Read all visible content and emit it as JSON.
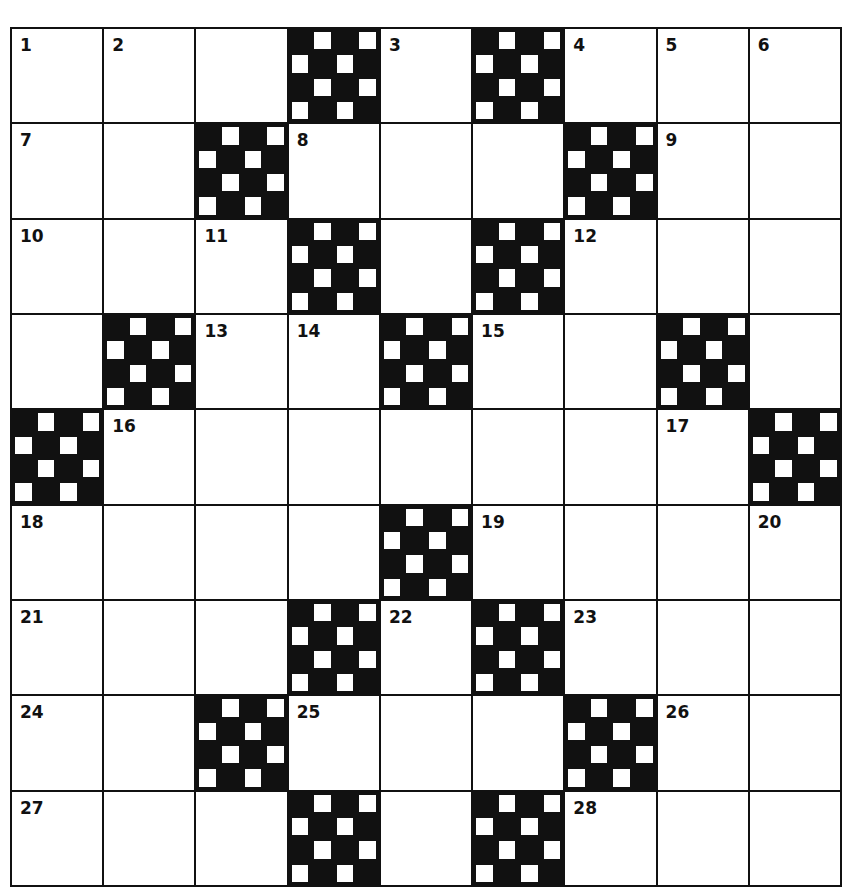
{
  "puzzle": {
    "rows": 9,
    "cols": 9,
    "colors": {
      "ink": "#111111",
      "paper": "#ffffff"
    },
    "grid": [
      [
        "1",
        "2",
        "",
        "#",
        "3",
        "#",
        "4",
        "5",
        "6"
      ],
      [
        "7",
        "",
        "#",
        "8",
        "",
        "",
        "#",
        "9",
        ""
      ],
      [
        "10",
        "",
        "11",
        "#",
        "",
        "#",
        "12",
        "",
        ""
      ],
      [
        "",
        "#",
        "13",
        "14",
        "#",
        "15",
        "",
        "#",
        ""
      ],
      [
        "#",
        "16",
        "",
        "",
        "",
        "",
        "",
        "17",
        "#"
      ],
      [
        "18",
        "",
        "",
        "",
        "#",
        "19",
        "",
        "",
        "20"
      ],
      [
        "21",
        "",
        "",
        "#",
        "22",
        "#",
        "23",
        "",
        ""
      ],
      [
        "24",
        "",
        "#",
        "25",
        "",
        "",
        "#",
        "26",
        ""
      ],
      [
        "27",
        "",
        "",
        "#",
        "",
        "#",
        "28",
        "",
        ""
      ]
    ],
    "numbers": [
      "1",
      "2",
      "3",
      "4",
      "5",
      "6",
      "7",
      "8",
      "9",
      "10",
      "11",
      "12",
      "13",
      "14",
      "15",
      "16",
      "17",
      "18",
      "19",
      "20",
      "21",
      "22",
      "23",
      "24",
      "25",
      "26",
      "27",
      "28"
    ]
  }
}
